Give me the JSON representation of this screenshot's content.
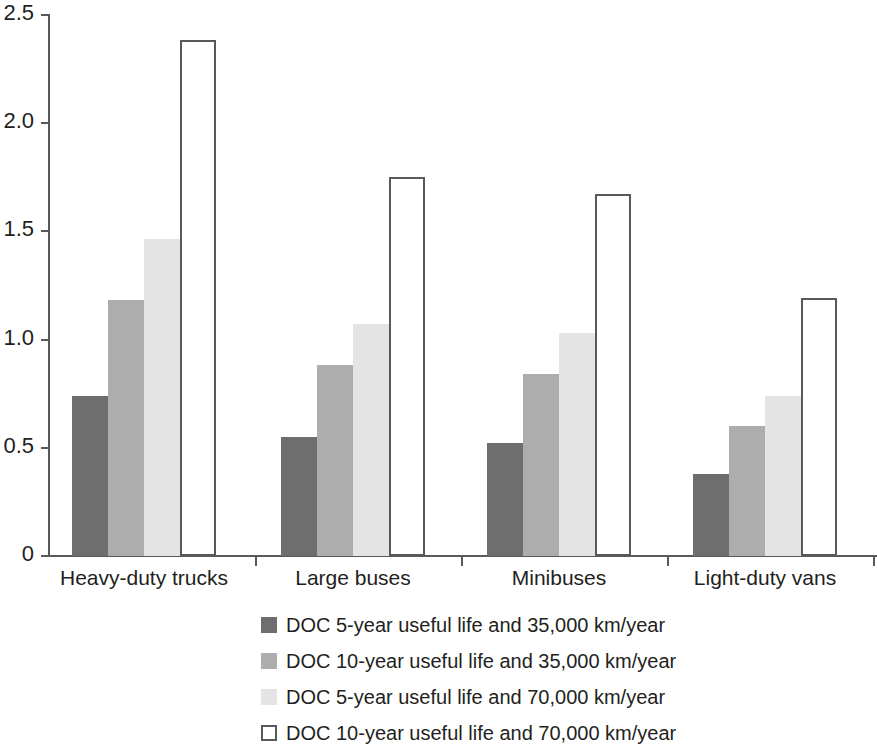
{
  "chart_data": {
    "type": "bar",
    "title": "",
    "subtitle": "",
    "xlabel": "",
    "ylabel": "",
    "ylim": [
      0,
      2.5
    ],
    "grid": false,
    "legend_position": "bottom",
    "categories": [
      "Heavy-duty trucks",
      "Large buses",
      "Minibuses",
      "Light-duty vans"
    ],
    "ytick_labels": [
      "0",
      "0.5",
      "1.0",
      "1.5",
      "2.0",
      "2.5"
    ],
    "ytick_values": [
      0,
      0.5,
      1.0,
      1.5,
      2.0,
      2.5
    ],
    "series": [
      {
        "name": "DOC 5-year useful life and 35,000 km/year",
        "color": "#6e6e6e",
        "style": "filled",
        "values": [
          0.74,
          0.55,
          0.52,
          0.38
        ]
      },
      {
        "name": "DOC 10-year useful life and 35,000 km/year",
        "color": "#adadad",
        "style": "filled",
        "values": [
          1.18,
          0.88,
          0.84,
          0.6
        ]
      },
      {
        "name": "DOC 5-year useful life and 70,000 km/year",
        "color": "#e4e4e4",
        "style": "filled",
        "values": [
          1.46,
          1.07,
          1.03,
          0.74
        ]
      },
      {
        "name": "DOC 10-year useful life and 70,000 km/year",
        "color": "#ffffff",
        "style": "outline",
        "values": [
          2.38,
          1.75,
          1.67,
          1.19
        ]
      }
    ]
  },
  "axis": {
    "outline_color": "#58595b",
    "text_color": "#231f20"
  }
}
